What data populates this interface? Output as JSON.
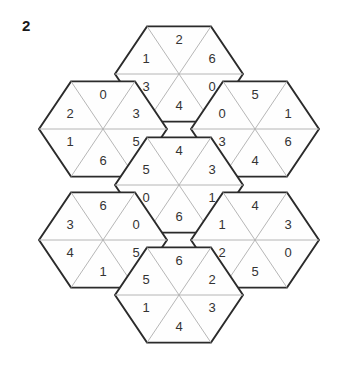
{
  "page": {
    "label": "2",
    "background_color": "#ffffff",
    "outline_color": "#2b2b2b",
    "divider_color": "#aeaeae",
    "digit_color": "#333333"
  },
  "puzzle": {
    "type": "hexagon-triangle-digit-puzzle",
    "hexagon_count": 7,
    "cells_per_hexagon": 6,
    "cell_order": [
      "top",
      "upper-left",
      "upper-right",
      "lower-left",
      "lower-right",
      "bottom"
    ],
    "hexagons": [
      {
        "id": "hex-top",
        "name": "top",
        "center": {
          "x": 179,
          "y": 74
        },
        "values": {
          "top": "2",
          "upper-left": "1",
          "upper-right": "6",
          "lower-left": "3",
          "lower-right": "0",
          "bottom": "4"
        }
      },
      {
        "id": "hex-upper-left",
        "name": "upper-left",
        "center": {
          "x": 103,
          "y": 129
        },
        "values": {
          "top": "0",
          "upper-left": "2",
          "upper-right": "3",
          "lower-left": "1",
          "lower-right": "5",
          "bottom": "6"
        }
      },
      {
        "id": "hex-upper-right",
        "name": "upper-right",
        "center": {
          "x": 255,
          "y": 129
        },
        "values": {
          "top": "5",
          "upper-left": "0",
          "upper-right": "1",
          "lower-left": "3",
          "lower-right": "6",
          "bottom": "4"
        }
      },
      {
        "id": "hex-center",
        "name": "center",
        "center": {
          "x": 179,
          "y": 185
        },
        "values": {
          "top": "4",
          "upper-left": "5",
          "upper-right": "3",
          "lower-left": "0",
          "lower-right": "1",
          "bottom": "6"
        }
      },
      {
        "id": "hex-lower-left",
        "name": "lower-left",
        "center": {
          "x": 103,
          "y": 240
        },
        "values": {
          "top": "6",
          "upper-left": "3",
          "upper-right": "0",
          "lower-left": "4",
          "lower-right": "5",
          "bottom": "1"
        }
      },
      {
        "id": "hex-lower-right",
        "name": "lower-right",
        "center": {
          "x": 255,
          "y": 240
        },
        "values": {
          "top": "4",
          "upper-left": "1",
          "upper-right": "3",
          "lower-left": "2",
          "lower-right": "0",
          "bottom": "5"
        }
      },
      {
        "id": "hex-bottom",
        "name": "bottom",
        "center": {
          "x": 179,
          "y": 295
        },
        "values": {
          "top": "6",
          "upper-left": "5",
          "upper-right": "2",
          "lower-left": "1",
          "lower-right": "3",
          "bottom": "4"
        }
      }
    ]
  }
}
